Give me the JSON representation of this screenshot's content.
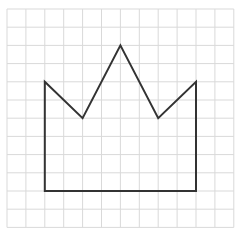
{
  "diagram": {
    "type": "grid-figure",
    "grid": {
      "columns": 12,
      "rows": 12,
      "origin_px": [
        7,
        9
      ],
      "cell_width_px": 18.9,
      "cell_height_px": 18.2,
      "line_color": "#d9d9d9",
      "line_width": 1
    },
    "shape": {
      "name": "crown",
      "stroke_color": "#333333",
      "stroke_width": 2,
      "fill": "none",
      "vertices_grid": [
        [
          2,
          4
        ],
        [
          4,
          6
        ],
        [
          6,
          2
        ],
        [
          8,
          6
        ],
        [
          10,
          4
        ],
        [
          10,
          10
        ],
        [
          2,
          10
        ]
      ],
      "closed": true
    },
    "background_color": "#ffffff"
  }
}
